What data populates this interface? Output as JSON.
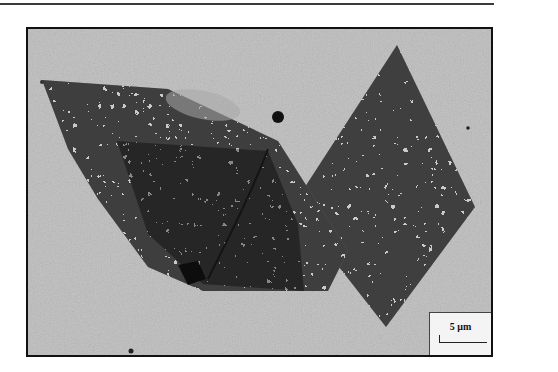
{
  "figure": {
    "type": "micrograph",
    "scale_bar": {
      "label": "5 μm",
      "position": "bottom-right"
    },
    "colors": {
      "background": "#b9b9b9",
      "flake_light": "#8f8f8f",
      "flake_dark": "#3c3c3c",
      "frame": "#111111",
      "scale_box": "#f4f4f4"
    }
  }
}
